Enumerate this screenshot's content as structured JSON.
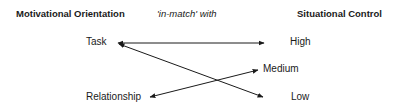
{
  "headers": {
    "left": "Motivational Orientation",
    "middle": "'in-match' with",
    "right": "Situational Control"
  },
  "orientations": [
    {
      "id": "task",
      "label": "Task"
    },
    {
      "id": "relationship",
      "label": "Relationship"
    }
  ],
  "control_levels": [
    {
      "id": "high",
      "label": "High"
    },
    {
      "id": "medium",
      "label": "Medium"
    },
    {
      "id": "low",
      "label": "Low"
    }
  ],
  "connections": [
    {
      "from": "Task",
      "to": "High",
      "bidirectional": true
    },
    {
      "from": "Task",
      "to": "Low",
      "bidirectional": true
    },
    {
      "from": "Relationship",
      "to": "Medium",
      "bidirectional": true
    }
  ],
  "colors": {
    "line": "#1a1a1a",
    "text": "#1a1a1a",
    "background": "#ffffff"
  }
}
